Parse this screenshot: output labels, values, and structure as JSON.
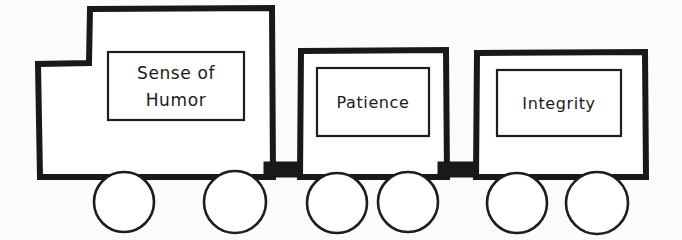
{
  "diagram": {
    "type": "hand-drawn-sketch",
    "medium": "ink on paper",
    "background_color": "#fbfbf9",
    "ink_color": "#1a1a18",
    "canvas": {
      "width": 682,
      "height": 240
    }
  },
  "train": {
    "cars": [
      {
        "id": "locomotive",
        "role": "locomotive",
        "label_lines": [
          "Sense of",
          "Humor"
        ],
        "label_full": "Sense of Humor",
        "wheel_count": 2
      },
      {
        "id": "car-patience",
        "role": "wagon",
        "label_lines": [
          "Patience"
        ],
        "label_full": "Patience",
        "wheel_count": 2
      },
      {
        "id": "car-integrity",
        "role": "wagon",
        "label_lines": [
          "Integrity"
        ],
        "label_full": "Integrity",
        "wheel_count": 2
      }
    ],
    "couplers": [
      {
        "id": "coupler-1",
        "between": [
          "locomotive",
          "car-patience"
        ]
      },
      {
        "id": "coupler-2",
        "between": [
          "car-patience",
          "car-integrity"
        ]
      }
    ],
    "wheel_count_total": 6
  }
}
